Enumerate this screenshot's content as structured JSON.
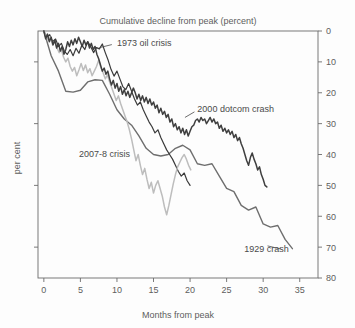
{
  "chart_data": {
    "type": "line",
    "title": "Cumulative decline from peak (percent)",
    "xlabel": "Months from peak",
    "ylabel": "per cent",
    "xlim": [
      -0.8,
      37.5
    ],
    "ylim": [
      0,
      80
    ],
    "y_inverted": true,
    "grid": false,
    "legend_position": "inline-annotations",
    "xticks": [
      0,
      5,
      10,
      15,
      20,
      25,
      30,
      35
    ],
    "xtick_labels": [
      "0",
      "5",
      "10",
      "15",
      "20",
      "25",
      "30",
      "35"
    ],
    "yticks": [
      0,
      10,
      20,
      30,
      40,
      50,
      60,
      70,
      80
    ],
    "ytick_labels": [
      "0",
      "10",
      "20",
      "30",
      "40",
      "50",
      "60",
      "70",
      "80"
    ],
    "ytick_side": "right",
    "series": [
      {
        "name": "1929 crash",
        "color": "#6e6e6e",
        "width": 1.4,
        "label_x": 27.4,
        "label_y": 70.5,
        "leader": [
          [
            30.6,
            69.6
          ],
          [
            32.4,
            70.6
          ]
        ],
        "x": [
          0,
          1,
          2,
          3,
          4,
          5,
          6,
          7,
          8,
          9,
          10,
          11,
          12,
          13,
          14,
          15,
          16,
          17,
          18,
          19,
          20,
          21,
          22,
          23,
          24,
          25,
          26,
          27,
          28,
          29,
          30,
          31,
          32,
          33,
          34
        ],
        "y": [
          0,
          8,
          13,
          19.5,
          19.8,
          19.2,
          16.5,
          15.8,
          16.0,
          20.5,
          25.5,
          28.5,
          30.5,
          34.0,
          38.0,
          40.0,
          40.5,
          40.0,
          38.0,
          37.0,
          38.5,
          43.0,
          43.5,
          43.0,
          47.0,
          51.0,
          52.0,
          56.5,
          58.0,
          57.0,
          62.5,
          63.5,
          63.0,
          67.5,
          70.5
        ]
      },
      {
        "name": "1973 oil crisis",
        "color": "#3a3a3a",
        "width": 1.2,
        "label_x": 10.0,
        "label_y": 3.6,
        "leader": [
          [
            9.3,
            4.4
          ],
          [
            7.6,
            5.4
          ]
        ],
        "x": [
          0,
          0.4,
          0.8,
          1.2,
          1.6,
          2.0,
          2.4,
          2.8,
          3.2,
          3.6,
          4.0,
          4.4,
          4.8,
          5.2,
          5.6,
          6.0,
          6.4,
          6.8,
          7.2,
          7.6,
          8.0,
          8.4,
          8.8,
          9.2,
          9.6,
          10.0,
          10.4,
          10.8,
          11.2,
          11.6,
          12.0,
          12.4,
          12.8,
          13.2,
          13.6,
          14.0,
          14.4,
          14.8,
          15.2,
          15.6,
          16.0,
          16.4,
          16.8,
          17.2,
          17.6,
          18.0,
          18.4,
          18.8,
          19.2,
          19.6,
          20.0
        ],
        "y": [
          0,
          2.0,
          1.2,
          3.5,
          2.6,
          5.0,
          4.0,
          6.5,
          7.6,
          6.0,
          8.0,
          5.6,
          7.2,
          4.6,
          6.0,
          3.4,
          5.0,
          7.0,
          5.4,
          5.8,
          4.2,
          7.0,
          9.5,
          12.5,
          14.6,
          13.0,
          15.5,
          18.0,
          19.0,
          17.0,
          19.5,
          22.0,
          24.0,
          23.0,
          25.5,
          27.5,
          29.5,
          31.0,
          33.0,
          32.0,
          34.5,
          36.5,
          38.5,
          40.0,
          41.5,
          43.5,
          45.5,
          47.0,
          46.0,
          48.5,
          50.0
        ]
      },
      {
        "name": "2007-8 crisis",
        "color": "#bdbdbd",
        "width": 1.5,
        "label_x": 4.8,
        "label_y": 39.6,
        "leader": null,
        "x": [
          0,
          0.3,
          0.6,
          0.9,
          1.2,
          1.5,
          1.8,
          2.1,
          2.4,
          2.7,
          3.0,
          3.3,
          3.6,
          3.9,
          4.2,
          4.5,
          4.8,
          5.1,
          5.4,
          5.7,
          6.0,
          6.3,
          6.6,
          6.9,
          7.2,
          7.5,
          7.8,
          8.1,
          8.4,
          8.7,
          9.0,
          9.3,
          9.6,
          9.9,
          10.2,
          10.5,
          10.8,
          11.1,
          11.4,
          11.7,
          12.0,
          12.3,
          12.6,
          12.9,
          13.2,
          13.5,
          13.8,
          14.1,
          14.4,
          14.7,
          15.0,
          15.3,
          15.6,
          15.9,
          16.2,
          16.5,
          16.8,
          17.1,
          17.4,
          17.7,
          18.0,
          18.3,
          18.6,
          18.9,
          19.2,
          19.5,
          19.8,
          20.1
        ],
        "y": [
          0,
          1.5,
          3.0,
          2.0,
          4.5,
          3.2,
          5.5,
          7.0,
          6.0,
          8.5,
          10.0,
          8.8,
          11.5,
          13.0,
          11.8,
          14.5,
          12.6,
          10.5,
          12.8,
          11.0,
          13.5,
          12.2,
          14.5,
          13.0,
          11.5,
          9.5,
          11.8,
          13.5,
          15.5,
          14.2,
          16.5,
          18.5,
          20.5,
          22.5,
          21.0,
          23.5,
          25.5,
          27.5,
          29.5,
          32.0,
          35.0,
          38.5,
          42.0,
          40.0,
          43.5,
          46.5,
          44.5,
          48.0,
          51.0,
          49.0,
          52.5,
          50.0,
          48.5,
          51.0,
          53.5,
          57.0,
          59.5,
          56.5,
          53.0,
          49.5,
          46.5,
          44.0,
          42.5,
          41.0,
          40.0,
          41.5,
          43.5,
          45.0
        ]
      },
      {
        "name": "2000 dotcom crash",
        "color": "#3f3f3f",
        "width": 1.5,
        "label_x": 21.0,
        "label_y": 25.0,
        "leader": [
          [
            20.6,
            26.2
          ],
          [
            19.3,
            28.0
          ]
        ],
        "x": [
          0,
          0.25,
          0.5,
          0.75,
          1.0,
          1.25,
          1.5,
          1.75,
          2.0,
          2.25,
          2.5,
          2.75,
          3.0,
          3.25,
          3.5,
          3.75,
          4.0,
          4.25,
          4.5,
          4.75,
          5.0,
          5.25,
          5.5,
          5.75,
          6.0,
          6.25,
          6.5,
          6.75,
          7.0,
          7.25,
          7.5,
          7.75,
          8.0,
          8.25,
          8.5,
          8.75,
          9.0,
          9.25,
          9.5,
          9.75,
          10.0,
          10.25,
          10.5,
          10.75,
          11.0,
          11.25,
          11.5,
          11.75,
          12.0,
          12.25,
          12.5,
          12.75,
          13.0,
          13.25,
          13.5,
          13.75,
          14.0,
          14.25,
          14.5,
          14.75,
          15.0,
          15.25,
          15.5,
          15.75,
          16.0,
          16.25,
          16.5,
          16.75,
          17.0,
          17.25,
          17.5,
          17.75,
          18.0,
          18.25,
          18.5,
          18.75,
          19.0,
          19.25,
          19.5,
          19.75,
          20.0,
          20.25,
          20.5,
          20.75,
          21.0,
          21.25,
          21.5,
          21.75,
          22.0,
          22.25,
          22.5,
          22.75,
          23.0,
          23.25,
          23.5,
          23.75,
          24.0,
          24.25,
          24.5,
          24.75,
          25.0,
          25.25,
          25.5,
          25.75,
          26.0,
          26.25,
          26.5,
          26.75,
          27.0,
          27.25,
          27.5,
          27.75,
          28.0,
          28.25,
          28.5,
          28.75,
          29.0,
          29.25,
          29.5,
          29.75,
          30.0,
          30.25,
          30.5
        ],
        "y": [
          0,
          2.5,
          1.0,
          3.5,
          2.0,
          4.5,
          3.0,
          5.5,
          4.0,
          6.5,
          5.0,
          7.5,
          6.0,
          3.5,
          5.0,
          3.0,
          4.5,
          2.5,
          4.0,
          2.0,
          3.5,
          5.0,
          3.0,
          4.5,
          3.5,
          5.5,
          4.0,
          6.0,
          5.0,
          7.5,
          9.0,
          11.0,
          13.0,
          12.0,
          14.0,
          13.0,
          15.5,
          17.5,
          16.0,
          18.5,
          17.0,
          19.5,
          18.0,
          20.5,
          19.0,
          21.0,
          19.5,
          21.5,
          20.0,
          18.5,
          20.0,
          22.0,
          20.5,
          22.5,
          21.0,
          23.0,
          21.5,
          23.5,
          22.0,
          24.0,
          23.0,
          25.0,
          24.0,
          26.5,
          25.0,
          27.0,
          26.0,
          28.0,
          27.0,
          29.5,
          28.5,
          31.0,
          30.0,
          32.0,
          31.0,
          33.0,
          31.5,
          33.5,
          32.0,
          34.0,
          32.5,
          31.0,
          30.5,
          29.0,
          28.5,
          29.5,
          28.0,
          29.0,
          28.5,
          30.0,
          29.0,
          28.0,
          29.5,
          28.5,
          30.0,
          29.5,
          31.5,
          30.5,
          32.5,
          31.5,
          33.0,
          32.0,
          33.5,
          32.5,
          34.5,
          33.5,
          35.5,
          34.5,
          36.5,
          38.0,
          40.0,
          42.0,
          43.5,
          41.0,
          39.5,
          41.5,
          43.0,
          45.0,
          44.0,
          46.5,
          48.0,
          50.0,
          50.5
        ]
      }
    ]
  },
  "colors": {
    "background": "#fdfdfd",
    "axis": "#6b6b6b",
    "text": "#5d5d5d"
  }
}
